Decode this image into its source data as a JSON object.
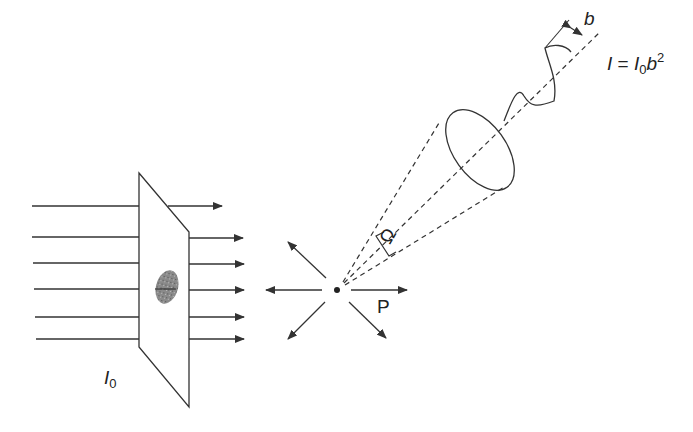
{
  "diagram": {
    "type": "light scattering schematic",
    "incident_beam": {
      "label_main": "I",
      "label_sub": "0",
      "ray_count": 6
    },
    "scatter_point": {
      "label": "P"
    },
    "solid_angle": {
      "symbol": "Ω"
    },
    "scattered_wave": {
      "amplitude_label": "b"
    },
    "formula": {
      "lhs": "I",
      "eq": " = ",
      "i0": "I",
      "i0_sub": "0",
      "b": "b",
      "exp": "2"
    },
    "colors": {
      "line": "#333333",
      "particle": "#777777",
      "background": "#ffffff"
    }
  }
}
